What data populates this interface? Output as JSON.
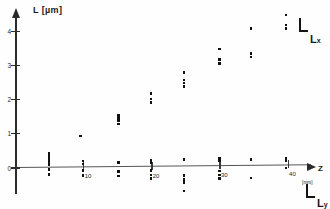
{
  "chart_data": {
    "type": "scatter",
    "title": "",
    "ylabel": "L [µm]",
    "xlabel": "Z",
    "xunit": "[mm]",
    "xlim": [
      0,
      43
    ],
    "ylim": [
      -1.2,
      4.6
    ],
    "grid": false,
    "legend_position": "right",
    "xticks": [
      10,
      20,
      30,
      40
    ],
    "yticks": [
      0,
      1,
      2,
      3,
      4
    ],
    "series": [
      {
        "name": "Lx",
        "label": "L",
        "sublabel": "x",
        "points": [
          [
            5.0,
            0.42
          ],
          [
            5.0,
            0.34
          ],
          [
            5.0,
            0.26
          ],
          [
            5.0,
            0.18
          ],
          [
            5.0,
            0.1
          ],
          [
            9.6,
            0.92
          ],
          [
            10.0,
            0.18
          ],
          [
            10.0,
            0.1
          ],
          [
            15.2,
            1.5
          ],
          [
            15.2,
            1.42
          ],
          [
            15.2,
            1.34
          ],
          [
            15.2,
            1.26
          ],
          [
            15.2,
            0.14
          ],
          [
            20.0,
            2.14
          ],
          [
            20.0,
            1.98
          ],
          [
            20.0,
            1.88
          ],
          [
            20.0,
            0.2
          ],
          [
            20.0,
            0.12
          ],
          [
            24.8,
            2.74
          ],
          [
            24.8,
            2.52
          ],
          [
            24.8,
            2.44
          ],
          [
            24.8,
            2.34
          ],
          [
            24.8,
            0.2
          ],
          [
            30.0,
            3.42
          ],
          [
            30.0,
            3.12
          ],
          [
            30.0,
            3.0
          ],
          [
            30.0,
            0.24
          ],
          [
            30.0,
            0.16
          ],
          [
            34.6,
            4.02
          ],
          [
            34.6,
            3.28
          ],
          [
            34.6,
            3.18
          ],
          [
            34.6,
            0.18
          ],
          [
            39.8,
            4.4
          ],
          [
            39.8,
            4.1
          ],
          [
            39.8,
            4.0
          ],
          [
            39.8,
            0.22
          ],
          [
            39.8,
            0.14
          ]
        ]
      },
      {
        "name": "Ly",
        "label": "L",
        "sublabel": "y",
        "points": [
          [
            5.0,
            -0.06
          ],
          [
            5.0,
            -0.2
          ],
          [
            10.0,
            -0.1
          ],
          [
            10.0,
            -0.24
          ],
          [
            15.2,
            -0.14
          ],
          [
            15.2,
            -0.26
          ],
          [
            20.0,
            -0.12
          ],
          [
            20.0,
            -0.24
          ],
          [
            20.0,
            -0.34
          ],
          [
            24.8,
            -0.26
          ],
          [
            24.8,
            -0.38
          ],
          [
            24.8,
            -0.48
          ],
          [
            24.8,
            -0.72
          ],
          [
            30.0,
            -0.14
          ],
          [
            30.0,
            -0.26
          ],
          [
            30.0,
            -0.36
          ],
          [
            34.6,
            -0.36
          ],
          [
            39.8,
            -0.08
          ]
        ]
      }
    ]
  }
}
